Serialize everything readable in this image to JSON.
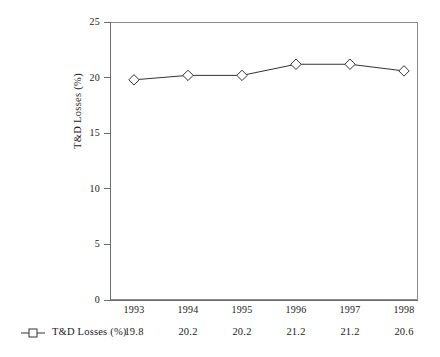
{
  "chart_data": {
    "type": "line",
    "title": "",
    "xlabel": "",
    "ylabel": "T&D Losses (%)",
    "categories": [
      "1993",
      "1994",
      "1995",
      "1996",
      "1997",
      "1998"
    ],
    "series": [
      {
        "name": "T&D Losses (%)",
        "values": [
          19.8,
          20.2,
          20.2,
          21.2,
          21.2,
          20.6
        ],
        "value_labels": [
          "19.8",
          "20.2",
          "20.2",
          "21.2",
          "21.2",
          "20.6"
        ],
        "marker": "open-diamond",
        "color": "#333333"
      }
    ],
    "ylim": [
      0,
      25
    ],
    "yticks": [
      0,
      5,
      10,
      15,
      20,
      25
    ],
    "ytick_labels": [
      "0",
      "5",
      "10",
      "15",
      "20",
      "25"
    ],
    "grid": false,
    "legend_position": "below-plot",
    "frame_color": "#8b8b8b",
    "background": "#ffffff"
  },
  "legend": {
    "symbol_name": "line-with-open-diamond-marker",
    "label": "T&D Losses (%)"
  }
}
